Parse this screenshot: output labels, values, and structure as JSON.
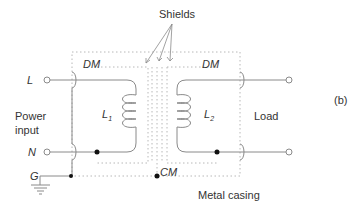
{
  "figure": {
    "panel_label": "(b)",
    "shields_label": "Shields",
    "left_side": {
      "line_label": "L",
      "neutral_label": "N",
      "ground_label": "G",
      "power_input_line1": "Power",
      "power_input_line2": "input",
      "dm_label": "DM",
      "inductor_label": "L",
      "inductor_subscript": "1"
    },
    "right_side": {
      "load_label": "Load",
      "dm_label": "DM",
      "inductor_label": "L",
      "inductor_subscript": "2"
    },
    "cm_label": "CM",
    "casing_label": "Metal casing"
  },
  "colors": {
    "wire": "#8a8a8a",
    "dotted": "#b0b0b0",
    "node": "#111111",
    "text": "#333333"
  }
}
